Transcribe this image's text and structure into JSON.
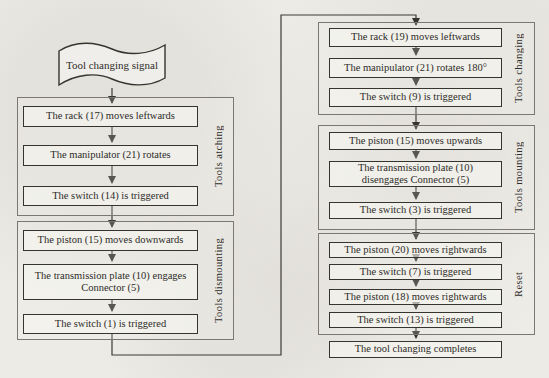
{
  "diagram": {
    "start": "Tool changing signal",
    "left_groups": [
      {
        "label": "Tools atching",
        "boxes": [
          "The rack (17) moves leftwards",
          "The manipulator (21) rotates",
          "The switch (14) is triggered"
        ]
      },
      {
        "label": "Tools dismounting",
        "boxes": [
          "The piston (15) moves downwards",
          "The transmission plate (10) engages Connector (5)",
          "The switch (1) is triggered"
        ]
      }
    ],
    "right_groups": [
      {
        "label": "Tools changing",
        "boxes": [
          "The rack (19) moves leftwards",
          "The manipulator (21) rotates 180°",
          "The switch (9) is triggered"
        ]
      },
      {
        "label": "Tools mounting",
        "boxes": [
          "The piston (15) moves upwards",
          "The transmission plate (10) disengages Connector (5)",
          "The switch (3) is triggered"
        ]
      },
      {
        "label": "Reset",
        "boxes": [
          "The piston (20) moves rightwards",
          "The switch (7) is triggered",
          "The piston (18) moves rightwards",
          "The switch (13) is triggered"
        ]
      }
    ],
    "end": "The tool changing completes"
  }
}
